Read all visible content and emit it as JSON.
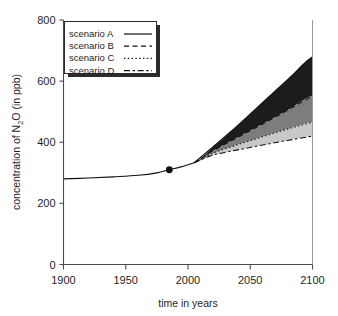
{
  "chart_data": {
    "type": "line",
    "title": "",
    "xlabel": "time in years",
    "ylabel": "concentration of N2O  (in ppb)",
    "ylabel_parts": {
      "pre": "concentration of N",
      "sub": "2",
      "post": "O  (in ppb)"
    },
    "xlim": [
      1900,
      2100
    ],
    "ylim": [
      0,
      800
    ],
    "xticks": [
      1900,
      1950,
      2000,
      2050,
      2100
    ],
    "xtick_labels": [
      "1900",
      "1950",
      "2000",
      "2050",
      "2100"
    ],
    "yticks": [
      0,
      200,
      400,
      600,
      800
    ],
    "ytick_labels": [
      "0",
      "200",
      "400",
      "600",
      "800"
    ],
    "grid": false,
    "legend_position": "upper-left",
    "marker_point": {
      "x": 1985,
      "y": 310,
      "label": ""
    },
    "historical": {
      "name": "observed",
      "x": [
        1900,
        1920,
        1940,
        1960,
        1975,
        1985,
        1995,
        2005
      ],
      "y": [
        280,
        283,
        287,
        292,
        300,
        310,
        320,
        333
      ]
    },
    "series": [
      {
        "name": "scenario A",
        "style": "solid",
        "color": "#111111",
        "x": [
          2005,
          2020,
          2040,
          2060,
          2080,
          2100
        ],
        "y": [
          333,
          385,
          455,
          530,
          605,
          680
        ]
      },
      {
        "name": "scenario B",
        "style": "dashed",
        "color": "#111111",
        "x": [
          2005,
          2020,
          2040,
          2060,
          2080,
          2100
        ],
        "y": [
          333,
          372,
          416,
          460,
          505,
          552
        ]
      },
      {
        "name": "scenario C",
        "style": "dotted",
        "color": "#111111",
        "x": [
          2005,
          2020,
          2040,
          2060,
          2080,
          2100
        ],
        "y": [
          333,
          364,
          392,
          418,
          443,
          466
        ]
      },
      {
        "name": "scenario D",
        "style": "dashdot",
        "color": "#111111",
        "x": [
          2005,
          2020,
          2040,
          2060,
          2080,
          2100
        ],
        "y": [
          333,
          358,
          375,
          391,
          406,
          420
        ]
      }
    ],
    "bands": [
      {
        "name": "band-A-B",
        "upper": "scenario A",
        "lower": "scenario B",
        "fill": "#1c1c1c"
      },
      {
        "name": "band-B-C",
        "upper": "scenario B",
        "lower": "scenario C",
        "fill": "#7d7d7d"
      },
      {
        "name": "band-C-D",
        "upper": "scenario C",
        "lower": "scenario D",
        "fill": "#c8c8c8"
      }
    ]
  },
  "legend": {
    "items": [
      {
        "label": "scenario A",
        "style": "solid"
      },
      {
        "label": "scenario B",
        "style": "dashed"
      },
      {
        "label": "scenario C",
        "style": "dotted"
      },
      {
        "label": "scenario D",
        "style": "dashdot"
      }
    ]
  }
}
